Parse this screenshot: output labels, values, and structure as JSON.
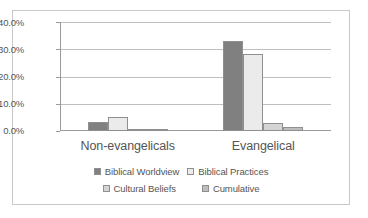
{
  "chart_data": {
    "type": "bar",
    "title": "",
    "xlabel": "",
    "ylabel": "",
    "categories": [
      "Non-evangelicals",
      "Evangelical"
    ],
    "series": [
      {
        "name": "Biblical Worldview",
        "color": "#808080",
        "values": [
          3.2,
          33.2
        ]
      },
      {
        "name": "Biblical Practices",
        "color": "#ebebeb",
        "values": [
          5.0,
          28.3
        ]
      },
      {
        "name": "Cultural Beliefs",
        "color": "#d4d4d4",
        "values": [
          0.2,
          2.8
        ]
      },
      {
        "name": "Cumulative",
        "color": "#bdbdbd",
        "values": [
          0.1,
          1.5
        ]
      }
    ],
    "ylim": [
      0,
      40
    ],
    "ytick_values": [
      0,
      10,
      20,
      30,
      40
    ],
    "ytick_labels": [
      "0.0%",
      "10.0%",
      "20.0%",
      "30.0%",
      "40.0%"
    ],
    "grid": true,
    "legend_position": "bottom"
  },
  "axis": {
    "y_labels": [
      "40.0%",
      "30.0%",
      "20.0%",
      "10.0%",
      "0.0%"
    ]
  },
  "legend": {
    "rows": [
      [
        {
          "label": "Biblical Worldview",
          "color": "#808080"
        },
        {
          "label": "Biblical Practices",
          "color": "#ebebeb"
        }
      ],
      [
        {
          "label": "Cultural Beliefs",
          "color": "#d4d4d4"
        },
        {
          "label": "Cumulative",
          "color": "#bdbdbd"
        }
      ]
    ]
  }
}
